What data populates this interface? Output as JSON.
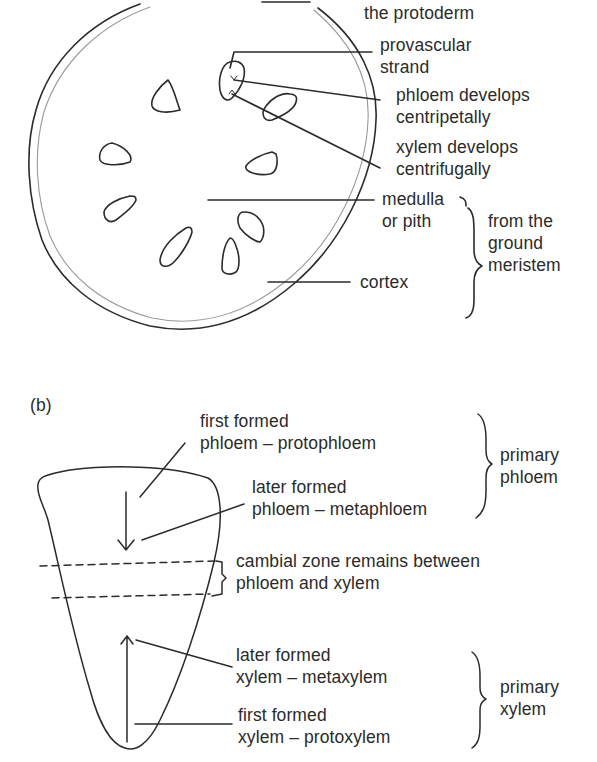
{
  "figure_a": {
    "labels": {
      "protoderm": [
        "the protoderm"
      ],
      "provascular": [
        "provascular",
        "strand"
      ],
      "phloem_dev": [
        "phloem develops",
        "centripetally"
      ],
      "xylem_dev": [
        "xylem develops",
        "centrifugally"
      ],
      "medulla": [
        "medulla",
        "or pith"
      ],
      "ground_meristem": [
        "from the",
        "ground",
        "meristem"
      ],
      "cortex": [
        "cortex"
      ]
    }
  },
  "figure_b": {
    "panel_label": "(b)",
    "labels": {
      "protophloem": [
        "first formed",
        "phloem – protophloem"
      ],
      "metaphloem": [
        "later formed",
        "phloem – metaphloem"
      ],
      "primary_phloem": [
        "primary",
        "phloem"
      ],
      "cambial": [
        "cambial zone remains between",
        "phloem and xylem"
      ],
      "metaxylem": [
        "later formed",
        "xylem – metaxylem"
      ],
      "protoxylem": [
        "first formed",
        "xylem – protoxylem"
      ],
      "primary_xylem": [
        "primary",
        "xylem"
      ]
    }
  },
  "colors": {
    "ink": "#2b2b2b",
    "inner_ring": "#9a9a9a",
    "background": "#ffffff"
  }
}
